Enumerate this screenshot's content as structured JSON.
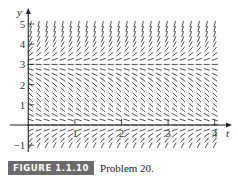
{
  "chart_data": {
    "type": "slope-field",
    "title": "",
    "xlabel": "t",
    "ylabel": "y",
    "x_ticks": [
      "1",
      "2",
      "3",
      "4"
    ],
    "y_ticks": [
      "-1",
      "1",
      "2",
      "3",
      "4",
      "5"
    ],
    "xlim": [
      0,
      4.1
    ],
    "ylim": [
      -1.1,
      5.3
    ],
    "equilibrium_lines": [
      0,
      3
    ],
    "slope_behavior": {
      "y_gt_3": "positive, increasing with y",
      "0_lt_y_lt_3": "negative",
      "y_lt_0": "positive"
    },
    "grid_columns": {
      "t_start": 0.05,
      "t_end": 4.0,
      "count": 24
    },
    "grid_rows": {
      "y_start": -1.0,
      "y_end": 5.1,
      "step": 0.25
    },
    "line_color": "#3a3a3a"
  },
  "caption": {
    "badge": "FIGURE 1.1.10",
    "text": "Problem 20."
  }
}
